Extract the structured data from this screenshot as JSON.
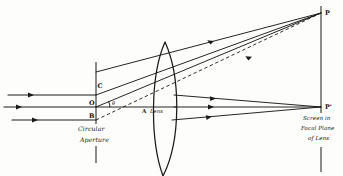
{
  "figure": {
    "domain": "diagram",
    "title": "",
    "background_color": "#fdfdfb",
    "ink_color": "#1a1a1a",
    "width": 343,
    "height": 176
  },
  "labels": {
    "point_c": "C",
    "point_o": "O",
    "point_b": "B",
    "point_a": "A",
    "lens": "Lens",
    "point_p": "P",
    "point_p_prime": "P'",
    "theta": "θ",
    "aperture_line1": "Circular",
    "aperture_line2": "Aperture",
    "screen_line1": "Screen in",
    "screen_line2": "Focal Plane",
    "screen_line3": "of Lens"
  },
  "elements": {
    "incoming_rays": [
      {
        "name": "upper-incoming-ray",
        "y": 95,
        "x_start": 8,
        "x_end": 96
      },
      {
        "name": "axis-incoming-ray",
        "y": 107,
        "x_start": 4,
        "x_end": 96
      },
      {
        "name": "lower-incoming-ray",
        "y": 120,
        "x_start": 12,
        "x_end": 96
      }
    ],
    "aperture": {
      "name": "circular-aperture",
      "x": 96,
      "y_top": 62,
      "y_bottom": 163,
      "gap_top": 124,
      "gap_bottom": 146
    },
    "lens": {
      "name": "biconvex-lens",
      "center_x": 165,
      "top_y": 42,
      "bottom_y": 175,
      "bulge": 14
    },
    "screen": {
      "name": "focal-plane-screen",
      "x": 321,
      "y_top": 6,
      "y_bottom": 172,
      "gap_top": 113,
      "gap_bottom": 147
    },
    "focus_points": {
      "p": {
        "x": 321,
        "y": 13
      },
      "p_prime": {
        "x": 321,
        "y": 107
      }
    },
    "diffracted_rays_upper": [
      {
        "name": "ray-c-to-p",
        "from_x": 96,
        "from_y": 72,
        "to_x": 321,
        "to_y": 13
      },
      {
        "name": "ray-o-to-p",
        "from_x": 96,
        "from_y": 95,
        "to_x": 321,
        "to_y": 13
      },
      {
        "name": "ray-b-to-p",
        "from_x": 96,
        "from_y": 107,
        "to_x": 321,
        "to_y": 13
      },
      {
        "name": "ray-lower-to-p",
        "from_x": 96,
        "from_y": 120,
        "to_x": 321,
        "to_y": 13
      }
    ],
    "dashed_ray": {
      "name": "dashed-construction-ray",
      "from_x": 96,
      "from_y": 120,
      "to_x": 321,
      "to_y": 13
    },
    "converging_rays_axis": [
      {
        "name": "ray-upper-to-pprime",
        "from_x": 180,
        "from_y": 95,
        "to_x": 321,
        "to_y": 107
      },
      {
        "name": "ray-axis-to-pprime",
        "from_x": 180,
        "from_y": 107,
        "to_x": 321,
        "to_y": 107
      },
      {
        "name": "ray-lower-to-pprime",
        "from_x": 180,
        "from_y": 120,
        "to_x": 321,
        "to_y": 107
      }
    ]
  }
}
